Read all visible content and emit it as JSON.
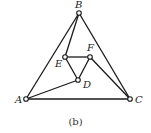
{
  "figure": {
    "caption": "(b)",
    "vertices": [
      {
        "id": "A",
        "label": "A",
        "x": 26,
        "y": 99,
        "lx": 15,
        "ly": 103
      },
      {
        "id": "B",
        "label": "B",
        "x": 79,
        "y": 13,
        "lx": 75,
        "ly": 8
      },
      {
        "id": "C",
        "label": "C",
        "x": 130,
        "y": 99,
        "lx": 135,
        "ly": 103
      },
      {
        "id": "D",
        "label": "D",
        "x": 78,
        "y": 80,
        "lx": 83,
        "ly": 88
      },
      {
        "id": "E",
        "label": "E",
        "x": 65,
        "y": 57,
        "lx": 55,
        "ly": 67
      },
      {
        "id": "F",
        "label": "F",
        "x": 90,
        "y": 57,
        "lx": 87,
        "ly": 51
      }
    ],
    "edges": [
      [
        "A",
        "B"
      ],
      [
        "B",
        "C"
      ],
      [
        "A",
        "C"
      ],
      [
        "B",
        "E"
      ],
      [
        "E",
        "F"
      ],
      [
        "E",
        "D"
      ],
      [
        "F",
        "D"
      ],
      [
        "D",
        "A"
      ],
      [
        "F",
        "C"
      ]
    ],
    "colors": {
      "stroke": "#1a1a1a",
      "background": "#ffffff"
    }
  }
}
